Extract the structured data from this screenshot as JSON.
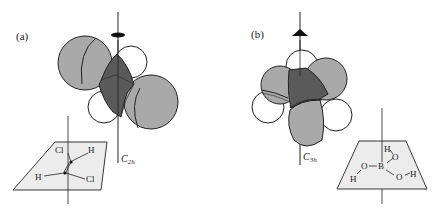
{
  "figure": {
    "panels": [
      {
        "id": "a",
        "label": "(a)",
        "axis_label_main": "C",
        "axis_label_sub": "2h",
        "symmetry_element": "twofold-axis (ellipse symbol)",
        "molecule": "trans-dichloroethylene",
        "plane_atoms": {
          "cl_top": "Cl",
          "h_top": "H",
          "h_bottom": "H",
          "cl_bottom": "Cl"
        }
      },
      {
        "id": "b",
        "label": "(b)",
        "axis_label_main": "C",
        "axis_label_sub": "3h",
        "symmetry_element": "threefold-axis (triangle symbol)",
        "molecule": "boric acid",
        "plane_atoms": {
          "h_top": "H",
          "o_top": "O",
          "o_left": "O",
          "b_center": "B",
          "o_right": "O",
          "h_right": "H",
          "h_left": "H"
        }
      }
    ],
    "colors": {
      "large_sphere": "#a9a9a9",
      "core": "#5a5a5a",
      "small_sphere": "#ffffff",
      "plane_fill": "#ececec",
      "stroke": "#222222"
    }
  }
}
